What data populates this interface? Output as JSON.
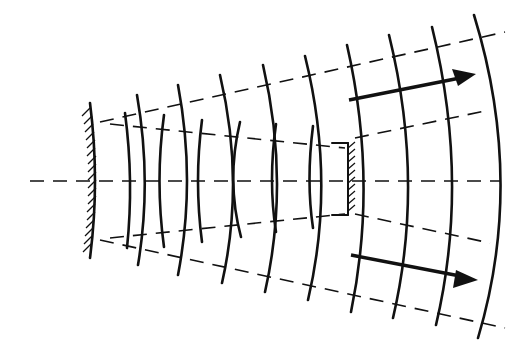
{
  "diagram": {
    "stroke_color": "#111111",
    "background": "#ffffff",
    "elements": {
      "left_mirror": "hatched curved mirror",
      "center_mirror": "small hatched plane mirror",
      "axis": "dashed horizontal optical axis",
      "rays": "dashed diverging ray lines",
      "wavefronts": "solid curved arcs",
      "arrows": [
        "upper propagation arrow",
        "lower propagation arrow"
      ]
    }
  }
}
